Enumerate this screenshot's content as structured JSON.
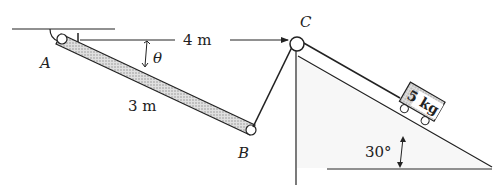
{
  "diagram": {
    "type": "mechanics-problem",
    "labels": {
      "point_a": "A",
      "point_b": "B",
      "point_c": "C",
      "angle_theta": "θ",
      "horizontal_distance": "4 m",
      "bar_length": "3 m",
      "mass": "5 kg",
      "incline_angle": "30°"
    },
    "colors": {
      "ink": "#222222",
      "bar_fill": "#c8c8c8",
      "incline_fill": "#f2f2f2"
    }
  }
}
